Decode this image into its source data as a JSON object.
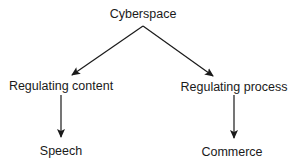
{
  "diagram": {
    "type": "tree",
    "nodes": [
      {
        "id": "cyberspace",
        "label": "Cyberspace",
        "x": 143,
        "y": 8
      },
      {
        "id": "regulating_content",
        "label": "Regulating content",
        "x": 61,
        "y": 80
      },
      {
        "id": "regulating_process",
        "label": "Regulating process",
        "x": 234,
        "y": 81
      },
      {
        "id": "speech",
        "label": "Speech",
        "x": 61,
        "y": 145
      },
      {
        "id": "commerce",
        "label": "Commerce",
        "x": 232,
        "y": 146
      }
    ],
    "edges": [
      {
        "from": "cyberspace",
        "to": "regulating_content"
      },
      {
        "from": "cyberspace",
        "to": "regulating_process"
      },
      {
        "from": "regulating_content",
        "to": "speech"
      },
      {
        "from": "regulating_process",
        "to": "commerce"
      }
    ],
    "colors": {
      "line": "#1a1a1a",
      "text": "#1a1a1a",
      "background": "#ffffff"
    }
  }
}
